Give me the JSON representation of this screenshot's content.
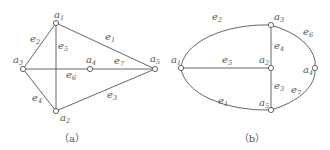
{
  "figures": [
    {
      "id": "a",
      "caption": "（a）",
      "vertices": [
        {
          "name": "a1",
          "base": "a",
          "sub": "1"
        },
        {
          "name": "a2",
          "base": "a",
          "sub": "2"
        },
        {
          "name": "a3",
          "base": "a",
          "sub": "3"
        },
        {
          "name": "a4",
          "base": "a",
          "sub": "4"
        },
        {
          "name": "a5",
          "base": "a",
          "sub": "5"
        }
      ],
      "edges": [
        {
          "name": "e1",
          "base": "e",
          "sub": "1",
          "from": "a1",
          "to": "a5"
        },
        {
          "name": "e2",
          "base": "e",
          "sub": "2",
          "from": "a1",
          "to": "a3"
        },
        {
          "name": "e3",
          "base": "e",
          "sub": "3",
          "from": "a2",
          "to": "a5"
        },
        {
          "name": "e4",
          "base": "e",
          "sub": "4",
          "from": "a3",
          "to": "a2"
        },
        {
          "name": "e5",
          "base": "e",
          "sub": "5",
          "from": "a1",
          "to": "a2"
        },
        {
          "name": "e6",
          "base": "e",
          "sub": "6",
          "from": "a3",
          "to": "a4"
        },
        {
          "name": "e7",
          "base": "e",
          "sub": "7",
          "from": "a4",
          "to": "a5"
        }
      ]
    },
    {
      "id": "b",
      "caption": "（b）",
      "vertices": [
        {
          "name": "a1",
          "base": "a",
          "sub": "1"
        },
        {
          "name": "a2",
          "base": "a",
          "sub": "2"
        },
        {
          "name": "a3",
          "base": "a",
          "sub": "3"
        },
        {
          "name": "a4",
          "base": "a",
          "sub": "4"
        },
        {
          "name": "a5",
          "base": "a",
          "sub": "5"
        }
      ],
      "edges": [
        {
          "name": "e1",
          "base": "e",
          "sub": "1",
          "from": "a1",
          "to": "a5"
        },
        {
          "name": "e2",
          "base": "e",
          "sub": "2",
          "from": "a1",
          "to": "a3"
        },
        {
          "name": "e3",
          "base": "e",
          "sub": "3",
          "from": "a2",
          "to": "a5"
        },
        {
          "name": "e4",
          "base": "e",
          "sub": "4",
          "from": "a3",
          "to": "a2"
        },
        {
          "name": "e5",
          "base": "e",
          "sub": "5",
          "from": "a1",
          "to": "a2"
        },
        {
          "name": "e6",
          "base": "e",
          "sub": "6",
          "from": "a3",
          "to": "a4"
        },
        {
          "name": "e7",
          "base": "e",
          "sub": "7",
          "from": "a4",
          "to": "a5"
        }
      ]
    }
  ]
}
